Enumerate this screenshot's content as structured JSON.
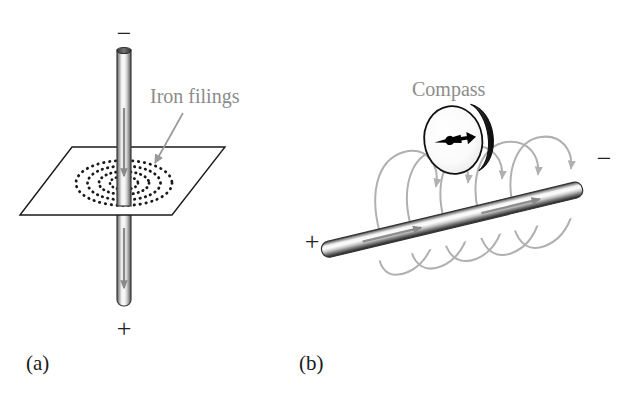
{
  "figure": {
    "background_color": "#ffffff"
  },
  "colors": {
    "wire_outline": "#3a3a3a",
    "wire_light": "#f2f2f2",
    "wire_mid": "#b8b8b8",
    "wire_dark": "#4a4a4a",
    "field_line": "#b0b0b0",
    "filings_dots": "#1a1a1a",
    "label_gray": "#8c8c8c",
    "plane_outline": "#1a1a1a",
    "compass_needle": "#000000",
    "caption_black": "#1a1a1a"
  },
  "panel_a": {
    "caption": "(a)",
    "terminal_top": "−",
    "terminal_bottom": "+",
    "annotation_label": "Iron filings",
    "description": "Vertical current-carrying wire passing through a horizontal plane sprinkled with iron filings that align into concentric circles.",
    "filings_ring_count": 4,
    "current_direction": "downward",
    "plane_shape": "parallelogram"
  },
  "panel_b": {
    "caption": "(b)",
    "terminal_left": "+",
    "terminal_right": "−",
    "annotation_label": "Compass",
    "description": "Diagonal current-carrying wire with circular magnetic field lines encircling it and a compass whose needle aligns with the field.",
    "field_loop_count": 5,
    "current_direction": "from + toward −",
    "compass_needle_direction": "right"
  }
}
